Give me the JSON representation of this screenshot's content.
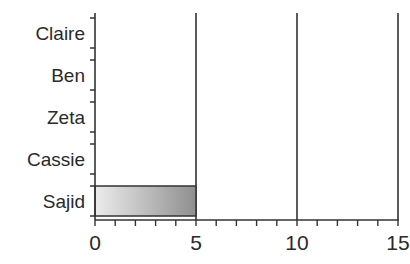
{
  "chart_data": {
    "type": "bar",
    "orientation": "horizontal",
    "title": "",
    "xlabel": "",
    "ylabel": "",
    "categories": [
      "Claire",
      "Ben",
      "Zeta",
      "Cassie",
      "Sajid"
    ],
    "values": [
      0,
      0,
      0,
      0,
      5
    ],
    "xlim": [
      0,
      15
    ],
    "x_ticks": [
      "0",
      "5",
      "10",
      "15"
    ],
    "x_minor_step": 1,
    "grid": "vertical major gridlines at 5, 10, 15",
    "legend": "none",
    "bar_fill": "gradient light gray to dark gray"
  },
  "colors": {
    "axis": "#333333",
    "bar_light": "#ececec",
    "bar_dark": "#8f8f8f"
  }
}
